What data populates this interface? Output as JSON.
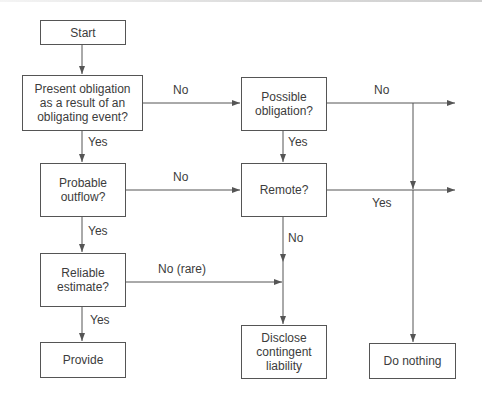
{
  "diagram": {
    "type": "flowchart",
    "nodes": {
      "start": "Start",
      "present_obligation": "Present obligation as a result of an obligating event?",
      "probable_outflow": "Probable outflow?",
      "reliable_estimate": "Reliable estimate?",
      "provide": "Provide",
      "possible_obligation": "Possible obligation?",
      "remote": "Remote?",
      "disclose": "Disclose contingent liability",
      "do_nothing": "Do nothing"
    },
    "edge_labels": {
      "present_no": "No",
      "present_yes": "Yes",
      "probable_no": "No",
      "probable_yes": "Yes",
      "reliable_no": "No (rare)",
      "reliable_yes": "Yes",
      "possible_no": "No",
      "possible_yes": "Yes",
      "remote_yes": "Yes",
      "remote_no": "No"
    },
    "edges": [
      {
        "from": "Start",
        "to": "Present obligation as a result of an obligating event?"
      },
      {
        "from": "Present obligation as a result of an obligating event?",
        "to": "Possible obligation?",
        "label": "No"
      },
      {
        "from": "Present obligation as a result of an obligating event?",
        "to": "Probable outflow?",
        "label": "Yes"
      },
      {
        "from": "Probable outflow?",
        "to": "Remote?",
        "label": "No"
      },
      {
        "from": "Probable outflow?",
        "to": "Reliable estimate?",
        "label": "Yes"
      },
      {
        "from": "Reliable estimate?",
        "to": "Disclose contingent liability",
        "label": "No (rare)"
      },
      {
        "from": "Reliable estimate?",
        "to": "Provide",
        "label": "Yes"
      },
      {
        "from": "Possible obligation?",
        "to": "Do nothing",
        "label": "No"
      },
      {
        "from": "Possible obligation?",
        "to": "Remote?",
        "label": "Yes"
      },
      {
        "from": "Remote?",
        "to": "Do nothing",
        "label": "Yes"
      },
      {
        "from": "Remote?",
        "to": "Disclose contingent liability",
        "label": "No"
      }
    ],
    "colors": {
      "line": "#555555",
      "text": "#3c3c3c",
      "background": "#ffffff"
    }
  }
}
